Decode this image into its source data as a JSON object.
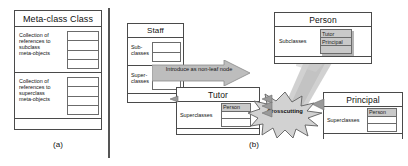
{
  "figure": {
    "panels": [
      {
        "id": "a",
        "caption": "(a)"
      },
      {
        "id": "b",
        "caption": "(b)"
      }
    ]
  },
  "panel_a": {
    "metaclass_box": {
      "title": "Meta-class Class",
      "compartments": [
        {
          "label_lines": [
            "Collection of",
            "references to",
            "subclass",
            "meta-objects"
          ],
          "slot_count": 4,
          "slots": [
            "",
            "",
            "",
            ""
          ]
        },
        {
          "label_lines": [
            "Collection of",
            "references to",
            "superclass",
            "meta-objects"
          ],
          "slot_count": 4,
          "slots": [
            "",
            "",
            "",
            ""
          ]
        }
      ],
      "footer": ""
    }
  },
  "panel_b": {
    "staff_box": {
      "title": "Staff",
      "compartments": [
        {
          "label_lines": [
            "Sub-",
            "classes"
          ],
          "slot_count": 2,
          "slots": [
            "",
            ""
          ]
        },
        {
          "label_lines": [
            "Super-",
            "classes"
          ],
          "slot_count": 2,
          "slots": [
            "",
            ""
          ]
        }
      ],
      "footer": ""
    },
    "person_box": {
      "title": "Person",
      "compartments": [
        {
          "label_lines": [
            "Subclasses"
          ],
          "slot_count": 3,
          "slots": [
            "Tutor",
            "Principal",
            ""
          ]
        }
      ],
      "footer": ""
    },
    "tutor_box": {
      "title": "Tutor",
      "compartments": [
        {
          "label_lines": [
            "Superclasses"
          ],
          "slot_count": 3,
          "slots": [
            "Person",
            "",
            ""
          ]
        }
      ],
      "footer": ""
    },
    "principal_box": {
      "title": "Principal",
      "compartments": [
        {
          "label_lines": [
            "Superclasses"
          ],
          "slot_count": 3,
          "slots": [
            "Person",
            "",
            ""
          ]
        }
      ],
      "footer": ""
    },
    "block_arrow": {
      "label": "Introduce as non-leaf node"
    },
    "starburst": {
      "label": "Crosscutting"
    }
  },
  "colors": {
    "line": "#4a4a4a",
    "slot_line": "#6b6b6b",
    "fill": "#ffffff",
    "filled_slot": "#c9c9c9",
    "arrow_fill": "#b8b8b8",
    "beam_fill": "#c4c4c4",
    "divider": "#555555",
    "text": "#111111"
  }
}
